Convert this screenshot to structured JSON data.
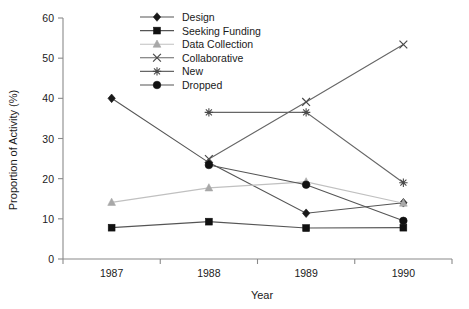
{
  "chart_data": {
    "type": "line",
    "title": "",
    "xlabel": "Year",
    "ylabel": "Proportion of Activity (%)",
    "categories": [
      "1987",
      "1988",
      "1989",
      "1990"
    ],
    "x": [
      1987,
      1988,
      1989,
      1990
    ],
    "ylim": [
      0,
      60
    ],
    "yticks": [
      0,
      10,
      20,
      30,
      40,
      50,
      60
    ],
    "ytick_labels": [
      "0",
      "10",
      "20",
      "30",
      "40",
      "50",
      "60"
    ],
    "grid": false,
    "legend_position": "top-center",
    "series": [
      {
        "name": "Design",
        "marker": "diamond",
        "color": "#1a1a1a",
        "line_color": "#555555",
        "values": [
          40.0,
          24.0,
          11.4,
          14.0
        ]
      },
      {
        "name": "Seeking Funding",
        "marker": "square",
        "color": "#111111",
        "line_color": "#555555",
        "values": [
          7.8,
          9.3,
          7.7,
          7.8
        ]
      },
      {
        "name": "Data Collection",
        "marker": "triangle",
        "color": "#a8a8a8",
        "line_color": "#c0c0c0",
        "values": [
          14.1,
          17.7,
          19.2,
          13.9
        ]
      },
      {
        "name": "Collaborative",
        "marker": "cross",
        "color": "#4a4a4a",
        "line_color": "#666666",
        "values": [
          null,
          24.9,
          39.1,
          53.4
        ]
      },
      {
        "name": "New",
        "marker": "asterisk",
        "color": "#4a4a4a",
        "line_color": "#666666",
        "values": [
          null,
          36.5,
          36.5,
          19.0
        ]
      },
      {
        "name": "Dropped",
        "marker": "circle",
        "color": "#111111",
        "line_color": "#555555",
        "values": [
          null,
          23.4,
          18.5,
          9.5
        ]
      }
    ]
  },
  "legend": {
    "items": [
      {
        "label": "Design"
      },
      {
        "label": "Seeking Funding"
      },
      {
        "label": "Data Collection"
      },
      {
        "label": "Collaborative"
      },
      {
        "label": "New"
      },
      {
        "label": "Dropped"
      }
    ]
  }
}
